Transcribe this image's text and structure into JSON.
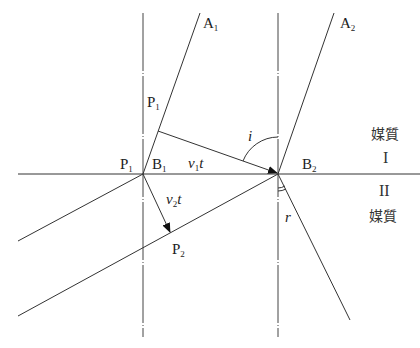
{
  "figure": {
    "labels": {
      "A1": {
        "base": "A",
        "sub": "1"
      },
      "A2": {
        "base": "A",
        "sub": "2"
      },
      "P1_upper": {
        "base": "P",
        "sub": "1"
      },
      "P1_left": {
        "base": "P",
        "sub": "1"
      },
      "B1": {
        "base": "B",
        "sub": "1"
      },
      "B2": {
        "base": "B",
        "sub": "2"
      },
      "P2": {
        "base": "P",
        "sub": "2"
      },
      "v1t": {
        "v": "v",
        "sub": "1",
        "t": "t"
      },
      "v2t": {
        "v": "v",
        "sub": "2",
        "t": "t"
      },
      "angle_i": "i",
      "angle_r": "r"
    },
    "medium_upper": {
      "name": "媒質",
      "numeral": "I"
    },
    "medium_lower": {
      "name": "媒質",
      "numeral": "II"
    },
    "caption_visible": false
  }
}
